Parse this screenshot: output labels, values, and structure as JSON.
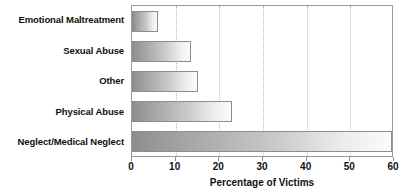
{
  "chart_data": {
    "type": "bar",
    "orientation": "horizontal",
    "title": "",
    "xlabel": "Percentage of Victims",
    "ylabel": "",
    "xlim": [
      0,
      60
    ],
    "xticks": [
      0,
      10,
      20,
      30,
      40,
      50,
      60
    ],
    "xtick_labels": [
      "0",
      "10",
      "20",
      "30",
      "40",
      "50",
      "60"
    ],
    "grid": true,
    "grid_axis": "x",
    "grid_style": "dotted",
    "legend": false,
    "categories": [
      "Emotional Maltreatment",
      "Sexual Abuse",
      "Other",
      "Physical Abuse",
      "Neglect/Medical Neglect"
    ],
    "values": [
      6,
      13.5,
      15,
      23,
      59.5
    ],
    "bar_fill": "gradient-gray-left-to-right",
    "bar_border_color": "#8d8d8d",
    "plot_border_color": "#9a9a9a",
    "gridline_color": "#b9b9b9",
    "text_color": "#111111",
    "background": "#ffffff"
  }
}
